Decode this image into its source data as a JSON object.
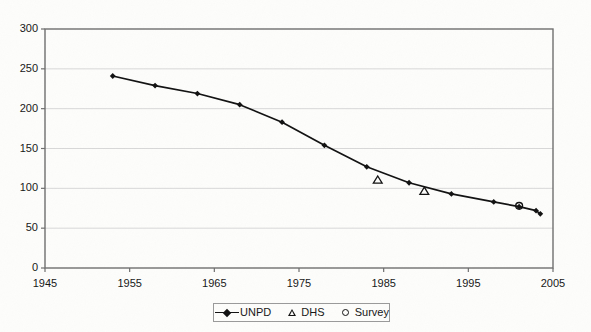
{
  "chart_data": {
    "type": "line",
    "title": "",
    "subtitle": "",
    "xlabel": "",
    "ylabel": "",
    "xlim": [
      1945,
      2005
    ],
    "ylim": [
      0,
      300
    ],
    "x_ticks": [
      1945,
      1955,
      1965,
      1975,
      1985,
      1995,
      2005
    ],
    "y_ticks": [
      0,
      50,
      100,
      150,
      200,
      250,
      300
    ],
    "grid": "horizontal",
    "legend_position": "bottom-center",
    "series": [
      {
        "name": "UNPD",
        "marker": "diamond",
        "line": true,
        "points": [
          {
            "x": 1953,
            "y": 241
          },
          {
            "x": 1958,
            "y": 229
          },
          {
            "x": 1963,
            "y": 219
          },
          {
            "x": 1968,
            "y": 205
          },
          {
            "x": 1973,
            "y": 183
          },
          {
            "x": 1978,
            "y": 154
          },
          {
            "x": 1983,
            "y": 127
          },
          {
            "x": 1988,
            "y": 107
          },
          {
            "x": 1993,
            "y": 93
          },
          {
            "x": 1998,
            "y": 83
          },
          {
            "x": 2001,
            "y": 77
          },
          {
            "x": 2003,
            "y": 72
          },
          {
            "x": 2003.5,
            "y": 68
          }
        ]
      },
      {
        "name": "DHS",
        "marker": "triangle",
        "line": false,
        "points": [
          {
            "x": 1984.3,
            "y": 111
          },
          {
            "x": 1989.8,
            "y": 97
          }
        ]
      },
      {
        "name": "Survey",
        "marker": "circle",
        "line": false,
        "points": [
          {
            "x": 2001,
            "y": 78
          }
        ]
      }
    ]
  },
  "axes": {
    "y_tick_labels": [
      "300",
      "250",
      "200",
      "150",
      "100",
      "50",
      "0"
    ],
    "x_tick_labels": [
      "1945",
      "1955",
      "1965",
      "1975",
      "1985",
      "1995",
      "2005"
    ]
  },
  "legend": {
    "entries": [
      {
        "label": "UNPD",
        "marker": "line-diamond"
      },
      {
        "label": "DHS",
        "marker": "triangle"
      },
      {
        "label": "Survey",
        "marker": "circle"
      }
    ]
  },
  "colors": {
    "background": "#fdfdfb",
    "series_line": "#111111",
    "plot_border": "#6e6e6e",
    "gridline": "#d8d8d8",
    "text": "#161616"
  }
}
